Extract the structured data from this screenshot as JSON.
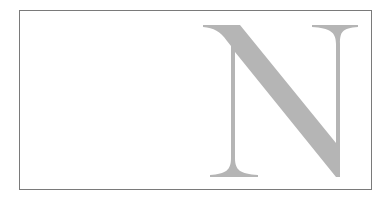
{
  "figure": {
    "letter": "N",
    "colors": {
      "background": "#ffffff",
      "frame_border": "#7a7a7a",
      "letter_fill": "#b5b5b5"
    }
  }
}
